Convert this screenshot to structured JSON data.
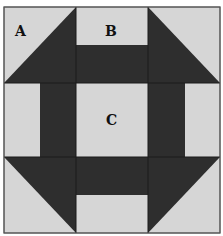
{
  "diagram": {
    "grid": "3x3",
    "colors": {
      "background": "#ffffff",
      "light": "#d6d6d6",
      "dark": "#2e2e2e",
      "line": "#1a1a1a"
    },
    "labels": {
      "a": "A",
      "b": "B",
      "c": "C"
    },
    "pieces": [
      {
        "id": "A",
        "type": "half-square triangle",
        "position": "top-left corner"
      },
      {
        "id": "B",
        "type": "two-rectangle strip unit",
        "position": "top-middle"
      },
      {
        "id": "C",
        "type": "plain square",
        "position": "center"
      }
    ]
  }
}
